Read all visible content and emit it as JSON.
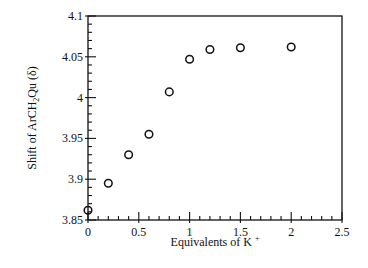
{
  "chart_data": {
    "type": "scatter",
    "title": "",
    "xlabel": "Equivalents of K",
    "xlabel_superscript": "+",
    "ylabel_parts": [
      "Shift of ArCH",
      "2",
      "Qu (δ)"
    ],
    "xlim": [
      0,
      2.5
    ],
    "ylim": [
      3.85,
      4.1
    ],
    "xticks": [
      0,
      0.5,
      1,
      1.5,
      2,
      2.5
    ],
    "xtick_labels": [
      "0",
      "0.5",
      "1",
      "1.5",
      "2",
      "2.5"
    ],
    "yticks": [
      3.85,
      3.9,
      3.95,
      4,
      4.05,
      4.1
    ],
    "ytick_labels": [
      "3.85",
      "3.9",
      "3.95",
      "4",
      "4.05",
      "4.1"
    ],
    "x_minor_step": 0.1,
    "y_minor_step": 0.01,
    "grid": false,
    "marker": "open-circle",
    "series": [
      {
        "name": "ArCH2Qu shift",
        "x": [
          0,
          0.2,
          0.4,
          0.6,
          0.8,
          1.0,
          1.2,
          1.5,
          2.0
        ],
        "y": [
          3.862,
          3.895,
          3.93,
          3.955,
          4.007,
          4.047,
          4.059,
          4.061,
          4.062
        ]
      }
    ]
  }
}
